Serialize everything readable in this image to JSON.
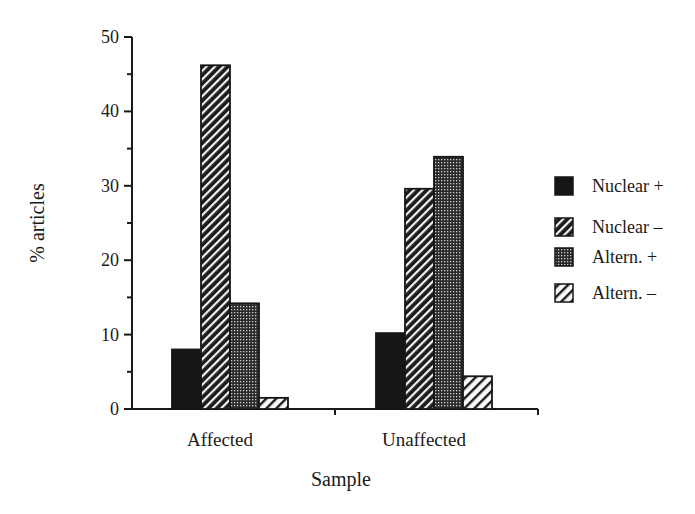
{
  "chart_data": {
    "type": "bar",
    "title": "",
    "xlabel": "Sample",
    "ylabel": "% articles",
    "ylim": [
      0,
      50
    ],
    "yticks": [
      0,
      10,
      20,
      30,
      40,
      50
    ],
    "grid": false,
    "legend_position": "right",
    "categories": [
      "Affected",
      "Unaffected"
    ],
    "series": [
      {
        "name": "Nuclear +",
        "pattern": "solid",
        "values": [
          8,
          10.2
        ]
      },
      {
        "name": "Nuclear –",
        "pattern": "dense-diagonal",
        "values": [
          46.2,
          29.6
        ]
      },
      {
        "name": "Altern. +",
        "pattern": "crosshatch",
        "values": [
          14.2,
          33.9
        ]
      },
      {
        "name": "Altern. –",
        "pattern": "sparse-diagonal",
        "values": [
          1.5,
          4.4
        ]
      }
    ]
  },
  "labels": {
    "ylabel": "% articles",
    "xlabel": "Sample",
    "yticks": [
      "0",
      "10",
      "20",
      "30",
      "40",
      "50"
    ],
    "categories": [
      "Affected",
      "Unaffected"
    ],
    "legend": [
      "Nuclear +",
      "Nuclear –",
      "Altern. +",
      "Altern. –"
    ]
  }
}
